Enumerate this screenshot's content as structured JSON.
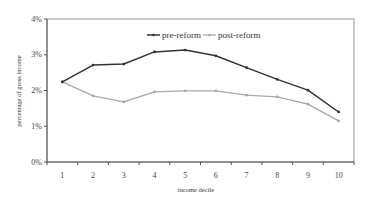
{
  "chart_data": {
    "type": "line",
    "title": "",
    "xlabel": "income decile",
    "ylabel": "percentage of gross income",
    "categories": [
      "1",
      "2",
      "3",
      "4",
      "5",
      "6",
      "7",
      "8",
      "9",
      "10"
    ],
    "x": [
      1,
      2,
      3,
      4,
      5,
      6,
      7,
      8,
      9,
      10
    ],
    "series": [
      {
        "name": "pre-reform",
        "color": "#333333",
        "marker": "dot",
        "values": [
          2.24,
          2.71,
          2.74,
          3.08,
          3.13,
          2.97,
          2.64,
          2.31,
          2.01,
          1.4
        ]
      },
      {
        "name": "post-reform",
        "color": "#a8a8a8",
        "marker": "dot",
        "values": [
          2.24,
          1.85,
          1.68,
          1.96,
          1.99,
          1.99,
          1.87,
          1.82,
          1.62,
          1.15
        ]
      }
    ],
    "ylim": [
      0,
      4
    ],
    "yticks": [
      "0%",
      "1%",
      "2%",
      "3%",
      "4%"
    ],
    "ytick_values": [
      0,
      1,
      2,
      3,
      4
    ],
    "grid": false,
    "legend_position": "top-center-inside"
  },
  "axes": {
    "x_label": "income decile",
    "y_label": "percentage of gross income"
  },
  "legend": {
    "items": [
      {
        "label": "pre-reform"
      },
      {
        "label": "post-reform"
      }
    ]
  }
}
